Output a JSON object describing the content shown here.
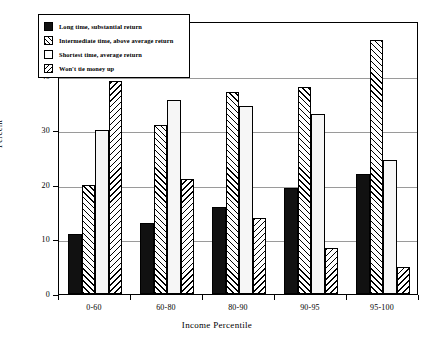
{
  "chart_data": {
    "type": "bar",
    "title": "",
    "xlabel": "Income Percentile",
    "ylabel": "Percent",
    "categories": [
      "0-60",
      "60-80",
      "80-90",
      "90-95",
      "95-100"
    ],
    "ylim": [
      0,
      50
    ],
    "yticks": [
      0,
      10,
      20,
      30,
      40,
      50
    ],
    "grid": true,
    "legend_position": "upper-left",
    "series": [
      {
        "name": "Long time, substantial return",
        "pattern": "solid",
        "values": [
          11,
          13,
          16,
          19.5,
          22
        ]
      },
      {
        "name": "Intermediate time, above average return",
        "pattern": "hatchfwd",
        "values": [
          20,
          31,
          37,
          38,
          46.5
        ]
      },
      {
        "name": "Shortest time, average return",
        "pattern": "plain",
        "values": [
          30,
          35.5,
          34.5,
          33,
          24.5
        ]
      },
      {
        "name": "Won't tie money up",
        "pattern": "hatchback",
        "values": [
          39,
          21,
          14,
          8.5,
          5
        ]
      }
    ]
  }
}
